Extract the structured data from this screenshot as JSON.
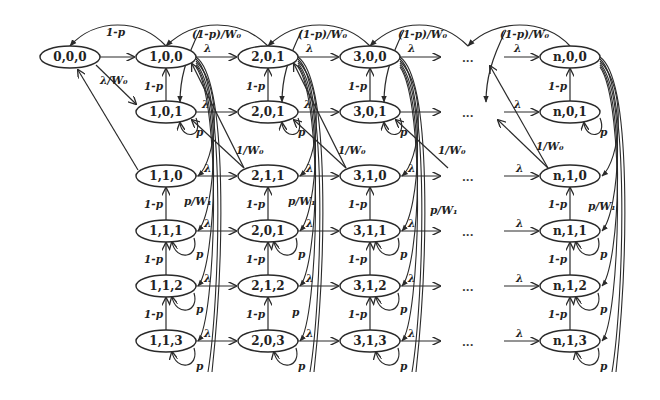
{
  "diagram": {
    "type": "markov-chain-state-diagram",
    "columns": [
      "0",
      "1",
      "2",
      "3",
      "...",
      "n"
    ],
    "nodes": {
      "n000": "0,0,0",
      "c1": [
        "1,0,0",
        "1,0,1",
        "1,1,0",
        "1,1,1",
        "1,1,2",
        "1,1,3"
      ],
      "c2": [
        "2,0,1",
        "2,0,1",
        "2,1,1",
        "2,0,1",
        "2,1,2",
        "2,0,3"
      ],
      "c3": [
        "3,0,0",
        "3,0,1",
        "3,1,0",
        "3,1,1",
        "3,1,2",
        "3,1,3"
      ],
      "cn": [
        "n,0,0",
        "n,0,1",
        "n,1,0",
        "n,1,1",
        "n,1,2",
        "n,1,3"
      ]
    },
    "ellipsis": "...",
    "edge_labels": {
      "one_minus_p": "1-p",
      "lambda": "λ",
      "lambda_over_w0": "λ/W₀",
      "one_minus_p_over_w0": "(1-p)/W₀",
      "one_over_w0": "1/W₀",
      "p_over_w1": "p/W₁",
      "p": "p"
    }
  }
}
